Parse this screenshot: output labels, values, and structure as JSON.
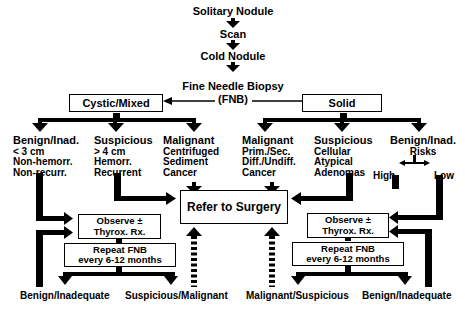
{
  "flow": {
    "top": [
      "Solitary Nodule",
      "Scan",
      "Cold Nodule"
    ],
    "fnb_line1": "Fine Needle Biopsy",
    "fnb_line2": "(FNB)"
  },
  "branches": {
    "left": {
      "label": "Cystic/Mixed"
    },
    "right": {
      "label": "Solid"
    }
  },
  "left_outcomes": [
    {
      "title": "Benign/Inad.",
      "lines": [
        "< 3 cm",
        "Non-hemorr.",
        "Non-recurr."
      ]
    },
    {
      "title": "Suspicious",
      "lines": [
        "> 4 cm",
        "Hemorr.",
        "Recurrent"
      ]
    },
    {
      "title": "Malignant",
      "lines": [
        "Centrifuged",
        "Sediment",
        "Cancer"
      ]
    }
  ],
  "right_outcomes": [
    {
      "title": "Malignant",
      "lines": [
        "Prim./Sec.",
        "Diff./Undiff.",
        "Cancer"
      ]
    },
    {
      "title": "Suspicious",
      "lines": [
        "Cellular",
        "Atypical",
        "Adenomas"
      ]
    },
    {
      "title": "Benign/Inad.",
      "lines": [
        "Risks"
      ]
    }
  ],
  "risks": {
    "high": "High",
    "low": "Low"
  },
  "center": {
    "refer": "Refer to Surgery"
  },
  "observe": {
    "line1": "Observe ±",
    "line2": "Thyrox. Rx."
  },
  "repeat": {
    "line1": "Repeat FNB",
    "line2": "every 6-12 months"
  },
  "bottom": {
    "left_a": "Benign/Inadequate",
    "left_b": "Suspicious/Malignant",
    "right_a": "Malignant/Suspicious",
    "right_b": "Benign/Inadequate"
  }
}
